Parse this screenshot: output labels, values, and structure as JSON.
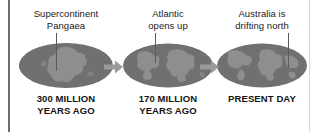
{
  "figure": {
    "background_color": "#ffffff",
    "globe_ocean_color": "#6f7070",
    "globe_land_color": "#8d8e8d",
    "arrow_color": "#9a9a9a",
    "text_color": "#1a1a1a",
    "rule_color": "#6d6d6d"
  },
  "stages": [
    {
      "callout_lines": [
        "Supercontinent",
        "Pangaea"
      ],
      "caption_lines": [
        "300 MILLION",
        "YEARS AGO"
      ],
      "globe_name": "globe-pangaea"
    },
    {
      "callout_lines": [
        "Atlantic",
        "opens up"
      ],
      "caption_lines": [
        "170 MILLION",
        "YEARS AGO"
      ],
      "globe_name": "globe-170-million"
    },
    {
      "callout_lines": [
        "Australia is",
        "drifting north"
      ],
      "caption_lines": [
        "PRESENT DAY"
      ],
      "globe_name": "globe-present-day"
    }
  ],
  "arrows": [
    {
      "label": "arrow-stage-1-to-2"
    },
    {
      "label": "arrow-stage-2-to-3"
    }
  ]
}
